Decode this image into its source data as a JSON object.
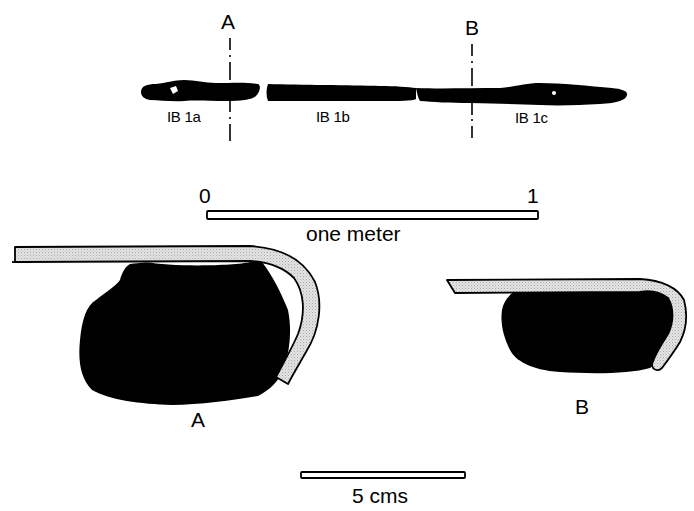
{
  "figure": {
    "type": "archaeological artifact drawing",
    "plan_view": {
      "section_markers": [
        {
          "id": "A",
          "label": "A",
          "x": 230
        },
        {
          "id": "B",
          "label": "B",
          "x": 472
        }
      ],
      "pieces": [
        {
          "id": "IB1a",
          "label": "IB 1a"
        },
        {
          "id": "IB1b",
          "label": "IB 1b"
        },
        {
          "id": "IB1c",
          "label": "IB 1c"
        }
      ]
    },
    "meter_scale": {
      "start_label": "0",
      "end_label": "1",
      "caption": "one meter"
    },
    "sections": [
      {
        "id": "A",
        "label": "A"
      },
      {
        "id": "B",
        "label": "B"
      }
    ],
    "cm_scale": {
      "caption": "5 cms"
    },
    "colors": {
      "ink": "#000000",
      "sheath_fill": "#d9d9d9",
      "background": "#ffffff"
    }
  }
}
